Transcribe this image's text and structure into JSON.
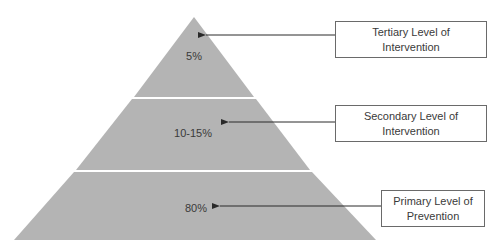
{
  "diagram": {
    "type": "pyramid",
    "fill_color": "#b4b4b4",
    "line_color": "#3a3a3a",
    "tiers": [
      {
        "level": "tertiary",
        "percent": "5%",
        "label_line1": "Tertiary Level of",
        "label_line2": "Intervention"
      },
      {
        "level": "secondary",
        "percent": "10-15%",
        "label_line1": "Secondary Level of",
        "label_line2": "Intervention"
      },
      {
        "level": "primary",
        "percent": "80%",
        "label_line1": "Primary Level of",
        "label_line2": "Prevention"
      }
    ]
  }
}
